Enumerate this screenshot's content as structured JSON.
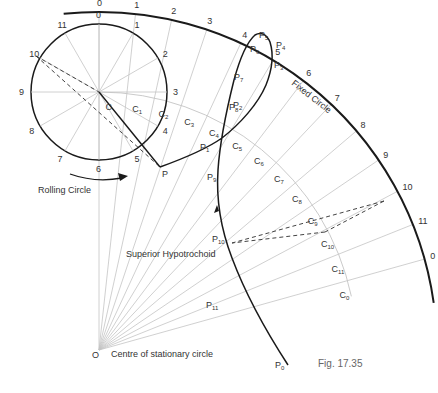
{
  "figure": {
    "caption": "Fig. 17.35",
    "title": "Superior Hypotrochoid"
  },
  "labels": {
    "rolling_circle": "Rolling Circle",
    "fixed_circle": "Fixed Circle",
    "curve": "Superior Hypotrochoid",
    "centre": "Centre of stationary circle",
    "O": "O",
    "C": "C",
    "P": "P"
  },
  "geometry": {
    "O": [
      99,
      350
    ],
    "C": [
      99,
      92
    ],
    "rolling_radius": 68,
    "fixed_radius": 338,
    "locus_radius": 258,
    "P": [
      160,
      167
    ],
    "divisions": 12
  },
  "rolling_circle_numbers": [
    "0",
    "1",
    "2",
    "3",
    "4",
    "5",
    "6",
    "7",
    "8",
    "9",
    "10",
    "11"
  ],
  "fixed_circle_numbers": [
    "0",
    "1",
    "2",
    "3",
    "4",
    "5",
    "6",
    "7",
    "8",
    "9",
    "10",
    "11",
    "0"
  ],
  "centre_points": [
    "C",
    "C1",
    "C2",
    "C3",
    "C4",
    "C5",
    "C6",
    "C7",
    "C8",
    "C9",
    "C10",
    "C11",
    "C0"
  ],
  "curve_points": [
    "P",
    "P1",
    "P2",
    "P3",
    "P4",
    "P5",
    "P6",
    "P7",
    "P8",
    "P9",
    "P10",
    "P11",
    "P0"
  ],
  "colors": {
    "thick": "#1a1a1a",
    "thin": "#bdbdbd",
    "dashed": "#444444",
    "text": "#333333"
  }
}
